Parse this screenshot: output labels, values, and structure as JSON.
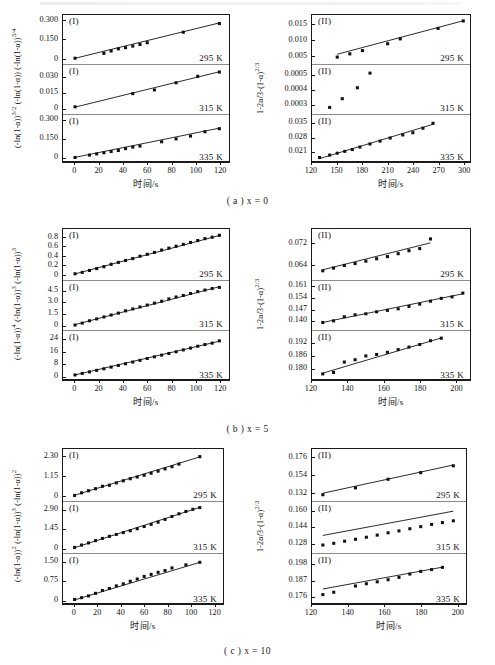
{
  "figure": {
    "xlabel": "时间/s",
    "captions": [
      {
        "id": "a",
        "text": "( a ) x = 0"
      },
      {
        "id": "b",
        "text": "( b ) x = 5"
      },
      {
        "id": "c",
        "text": "( c ) x = 10"
      }
    ],
    "series_marker": "filled-square",
    "line_color": "#111111",
    "marker_color": "#111111"
  },
  "chart_data": [
    {
      "type": "scatter",
      "panel": "a-left",
      "group": "( a ) x = 0",
      "tag": "(I)",
      "ylabel": "(-ln(1-α))^{3/2} (-ln(1-α)) (-ln(1-α))^{3/4}",
      "xlabel": "时间/s",
      "xlim": [
        -10,
        128
      ],
      "xticks": [
        0,
        20,
        40,
        60,
        80,
        100,
        120
      ],
      "grid": false,
      "legend": "none",
      "subplots": [
        {
          "label": "295 K",
          "tag": "(I)",
          "yticks": [
            "0",
            "0.150",
            "0.300"
          ],
          "ylim": [
            -0.02,
            0.315
          ],
          "ytickvals": [
            0,
            0.15,
            0.3
          ],
          "x": [
            0,
            24,
            30,
            36,
            42,
            48,
            54,
            60,
            90,
            120
          ],
          "y": [
            0.004,
            0.042,
            0.06,
            0.077,
            0.086,
            0.098,
            0.11,
            0.124,
            0.205,
            0.272
          ],
          "fit": {
            "intercept": 0.0035,
            "slope": 0.00228
          }
        },
        {
          "label": "315 K",
          "tag": "(I)",
          "yticks": [
            "0",
            "0.015",
            "0.030"
          ],
          "ylim": [
            -0.003,
            0.0385
          ],
          "ytickvals": [
            0,
            0.015,
            0.03
          ],
          "x": [
            0,
            48,
            66,
            84,
            102,
            120
          ],
          "y": [
            0.0005,
            0.0134,
            0.017,
            0.024,
            0.0303,
            0.0345
          ],
          "fit": {
            "intercept": 0.0002,
            "slope": 0.000288
          }
        },
        {
          "label": "335 K",
          "tag": "(I)",
          "yticks": [
            "0",
            "0.150",
            "0.300"
          ],
          "ylim": [
            -0.02,
            0.315
          ],
          "ytickvals": [
            0,
            0.15,
            0.3
          ],
          "x": [
            0,
            12,
            18,
            24,
            30,
            36,
            42,
            48,
            54,
            72,
            84,
            96,
            108,
            120
          ],
          "y": [
            0.003,
            0.022,
            0.031,
            0.04,
            0.05,
            0.058,
            0.073,
            0.085,
            0.093,
            0.127,
            0.15,
            0.172,
            0.206,
            0.23
          ],
          "fit": {
            "intercept": 0.004,
            "slope": 0.00192
          }
        }
      ]
    },
    {
      "type": "scatter",
      "panel": "a-right",
      "group": "( a ) x = 0",
      "tag": "(II)",
      "ylabel": "1-2α/3-(1-α)^{2/3}",
      "xlabel": "时间/s",
      "xlim": [
        120,
        308
      ],
      "xticks": [
        120,
        150,
        180,
        210,
        240,
        270,
        300
      ],
      "grid": false,
      "legend": "none",
      "subplots": [
        {
          "label": "295 K",
          "tag": "(II)",
          "yticks": [
            "0.005",
            "0.010",
            "0.015"
          ],
          "ylim": [
            0.0035,
            0.0168
          ],
          "ytickvals": [
            0.005,
            0.01,
            0.015
          ],
          "x": [
            150,
            165,
            180,
            210,
            225,
            270,
            300
          ],
          "y": [
            0.0048,
            0.0058,
            0.0068,
            0.0089,
            0.0104,
            0.0136,
            0.0159
          ],
          "fit": {
            "intercept": -0.0046,
            "slope": 6.85e-05
          }
        },
        {
          "label": "315 K",
          "tag": "(II)",
          "yticks": [
            "0.0003",
            "0.0004",
            "0.0005"
          ],
          "ylim": [
            0.000258,
            0.000545
          ],
          "ytickvals": [
            0.0003,
            0.0004,
            0.0005
          ],
          "x": [
            141,
            156,
            174,
            189
          ],
          "y": [
            0.000278,
            0.000337,
            0.000411,
            0.00051
          ],
          "fit": {
            "intercept": 0.0,
            "slope": 4.8e-06
          }
        },
        {
          "label": "335 K",
          "tag": "(II)",
          "yticks": [
            "0.021",
            "0.028",
            "0.035"
          ],
          "ylim": [
            0.0168,
            0.0375
          ],
          "ytickvals": [
            0.021,
            0.028,
            0.035
          ],
          "x": [
            129,
            141,
            150,
            159,
            168,
            177,
            189,
            201,
            213,
            228,
            240,
            252,
            264
          ],
          "y": [
            0.0182,
            0.0194,
            0.0203,
            0.0212,
            0.0221,
            0.0233,
            0.0248,
            0.0262,
            0.0277,
            0.0292,
            0.0303,
            0.0325,
            0.0349
          ],
          "fit": {
            "intercept": 0.00167,
            "slope": 0.000124
          }
        }
      ]
    },
    {
      "type": "scatter",
      "panel": "b-left",
      "group": "( b ) x = 5",
      "tag": "(I)",
      "ylabel": "(-ln(1-α))^{4} (-ln(1-α))^{3} (-ln(1-α))^{3}",
      "xlabel": "时间/s",
      "xlim": [
        -10,
        128
      ],
      "xticks": [
        0,
        20,
        40,
        60,
        80,
        100,
        120
      ],
      "grid": false,
      "legend": "none",
      "subplots": [
        {
          "label": "295 K",
          "tag": "(I)",
          "yticks": [
            "0",
            "0.2",
            "0.4",
            "0.6",
            "0.8"
          ],
          "ylim": [
            -0.04,
            0.9
          ],
          "ytickvals": [
            0,
            0.2,
            0.4,
            0.6,
            0.8
          ],
          "x": [
            0,
            6,
            12,
            18,
            24,
            30,
            36,
            42,
            48,
            54,
            60,
            66,
            72,
            78,
            84,
            90,
            96,
            102,
            108,
            114,
            120
          ],
          "y": [
            0.02,
            0.05,
            0.09,
            0.13,
            0.17,
            0.22,
            0.26,
            0.3,
            0.34,
            0.39,
            0.43,
            0.47,
            0.52,
            0.56,
            0.6,
            0.64,
            0.68,
            0.72,
            0.76,
            0.79,
            0.83
          ],
          "fit": {
            "intercept": 0.018,
            "slope": 0.00674
          }
        },
        {
          "label": "315 K",
          "tag": "(I)",
          "yticks": [
            "0",
            "1.5",
            "3.0",
            "4.5"
          ],
          "ylim": [
            -0.3,
            5.4
          ],
          "ytickvals": [
            0,
            1.5,
            3.0,
            4.5
          ],
          "x": [
            0,
            6,
            12,
            18,
            24,
            30,
            36,
            42,
            48,
            54,
            60,
            66,
            72,
            78,
            84,
            90,
            96,
            102,
            108,
            114,
            120
          ],
          "y": [
            0.05,
            0.3,
            0.6,
            0.85,
            1.1,
            1.35,
            1.6,
            1.9,
            2.15,
            2.4,
            2.65,
            2.9,
            3.15,
            3.45,
            3.7,
            3.9,
            4.15,
            4.4,
            4.6,
            4.8,
            4.95
          ],
          "fit": {
            "intercept": 0.1,
            "slope": 0.0412
          }
        },
        {
          "label": "335 K",
          "tag": "(I)",
          "yticks": [
            "0",
            "8",
            "16",
            "24"
          ],
          "ylim": [
            -1.5,
            27
          ],
          "ytickvals": [
            0,
            8,
            16,
            24
          ],
          "x": [
            0,
            6,
            12,
            18,
            24,
            30,
            36,
            42,
            48,
            54,
            60,
            66,
            72,
            78,
            84,
            90,
            96,
            102,
            108,
            114,
            120
          ],
          "y": [
            0.3,
            1.3,
            2.3,
            3.3,
            4.3,
            5.4,
            6.5,
            7.6,
            8.7,
            9.8,
            11.0,
            12.1,
            13.2,
            14.3,
            15.4,
            16.6,
            17.8,
            19.0,
            20.1,
            21.0,
            22.5
          ],
          "fit": {
            "intercept": 0.3,
            "slope": 0.183
          }
        }
      ]
    },
    {
      "type": "scatter",
      "panel": "b-right",
      "group": "( b ) x = 5",
      "tag": "(II)",
      "ylabel": "1-2α/3-(1-α)^{2/3}",
      "xlabel": "时间/s",
      "xlim": [
        120,
        208
      ],
      "xticks": [
        120,
        140,
        160,
        180,
        200
      ],
      "grid": false,
      "legend": "none",
      "subplots": [
        {
          "label": "295 K",
          "tag": "(II)",
          "yticks": [
            "0.064",
            "0.072"
          ],
          "ylim": [
            0.0595,
            0.0762
          ],
          "ytickvals": [
            0.064,
            0.072
          ],
          "x": [
            126,
            132,
            138,
            144,
            150,
            156,
            162,
            168,
            174,
            180,
            186
          ],
          "y": [
            0.0617,
            0.0627,
            0.0637,
            0.0644,
            0.0653,
            0.0662,
            0.067,
            0.0681,
            0.0692,
            0.07,
            0.0736
          ],
          "fit": {
            "intercept": 0.0409,
            "slope": 0.000168
          }
        },
        {
          "label": "315 K",
          "tag": "(II)",
          "yticks": [
            "0.140",
            "0.147",
            "0.154",
            "0.161"
          ],
          "ylim": [
            0.1358,
            0.1625
          ],
          "ytickvals": [
            0.14,
            0.147,
            0.154,
            0.161
          ],
          "x": [
            126,
            132,
            138,
            144,
            150,
            156,
            162,
            168,
            174,
            180,
            186,
            192,
            198,
            204
          ],
          "y": [
            0.139,
            0.14,
            0.1425,
            0.1437,
            0.1443,
            0.1455,
            0.1464,
            0.1473,
            0.1488,
            0.1502,
            0.152,
            0.1537,
            0.1546,
            0.1569
          ],
          "fit": {
            "intercept": 0.1108,
            "slope": 0.000224
          }
        },
        {
          "label": "335 K",
          "tag": "(II)",
          "yticks": [
            "0.180",
            "0.186",
            "0.192"
          ],
          "ylim": [
            0.1755,
            0.1962
          ],
          "ytickvals": [
            0.18,
            0.186,
            0.192
          ],
          "x": [
            126,
            132,
            138,
            144,
            150,
            156,
            162,
            168,
            174,
            180,
            186,
            192
          ],
          "y": [
            0.1773,
            0.178,
            0.1829,
            0.184,
            0.1858,
            0.1865,
            0.1875,
            0.1888,
            0.19,
            0.1912,
            0.193,
            0.1942
          ],
          "fit": {
            "intercept": 0.1459,
            "slope": 0.000252
          }
        }
      ]
    },
    {
      "type": "scatter",
      "panel": "c-left",
      "group": "( c ) x = 10",
      "tag": "(I)",
      "ylabel": "(-ln(1-α))^{2} (-ln(1-α))^{3} (-ln(1-α))^{2}",
      "xlabel": "时间/s",
      "xlim": [
        -10,
        128
      ],
      "xticks": [
        0,
        20,
        40,
        60,
        80,
        100,
        120
      ],
      "grid": false,
      "legend": "none",
      "subplots": [
        {
          "label": "295 K",
          "tag": "(I)",
          "yticks": [
            "0",
            "1.15",
            "2.30"
          ],
          "ylim": [
            -0.12,
            2.55
          ],
          "ytickvals": [
            0,
            1.15,
            2.3
          ],
          "x": [
            0,
            6,
            12,
            18,
            24,
            30,
            36,
            42,
            48,
            54,
            60,
            66,
            72,
            78,
            84,
            90,
            108
          ],
          "y": [
            0.03,
            0.18,
            0.3,
            0.42,
            0.56,
            0.62,
            0.76,
            0.88,
            1.0,
            1.1,
            1.2,
            1.32,
            1.44,
            1.57,
            1.7,
            1.85,
            2.28
          ],
          "fit": {
            "intercept": 0.04,
            "slope": 0.0206
          }
        },
        {
          "label": "315 K",
          "tag": "(I)",
          "yticks": [
            "0",
            "1.45",
            "2.90"
          ],
          "ylim": [
            -0.16,
            3.25
          ],
          "ytickvals": [
            0,
            1.45,
            2.9
          ],
          "x": [
            0,
            6,
            12,
            18,
            24,
            30,
            36,
            42,
            48,
            54,
            60,
            66,
            72,
            78,
            84,
            90,
            96,
            102,
            108
          ],
          "y": [
            0.04,
            0.22,
            0.38,
            0.55,
            0.72,
            0.88,
            1.02,
            1.16,
            1.3,
            1.45,
            1.62,
            1.78,
            1.95,
            2.16,
            2.38,
            2.58,
            2.76,
            2.92,
            3.05
          ],
          "fit": {
            "intercept": 0.02,
            "slope": 0.0282
          }
        },
        {
          "label": "335 K",
          "tag": "(I)",
          "yticks": [
            "0",
            "0.75",
            "1.50"
          ],
          "ylim": [
            -0.08,
            1.68
          ],
          "ytickvals": [
            0,
            0.75,
            1.5
          ],
          "x": [
            0,
            6,
            12,
            18,
            24,
            30,
            36,
            42,
            48,
            54,
            60,
            66,
            72,
            78,
            84,
            96,
            108
          ],
          "y": [
            0.02,
            0.09,
            0.16,
            0.26,
            0.37,
            0.45,
            0.55,
            0.63,
            0.73,
            0.82,
            0.92,
            1.0,
            1.08,
            1.15,
            1.25,
            1.37,
            1.47
          ],
          "fit": {
            "intercept": 0.005,
            "slope": 0.01355
          }
        }
      ]
    },
    {
      "type": "scatter",
      "panel": "c-right",
      "group": "( c ) x = 10",
      "tag": "(II)",
      "ylabel": "1-2α/3-(1-α)^{2/3}",
      "xlabel": "时间/s",
      "xlim": [
        120,
        205
      ],
      "xticks": [
        120,
        140,
        160,
        180,
        200
      ],
      "grid": false,
      "legend": "none",
      "subplots": [
        {
          "label": "295 K",
          "tag": "(II)",
          "yticks": [
            "0.132",
            "0.154",
            "0.176"
          ],
          "ylim": [
            0.1265,
            0.1822
          ],
          "ytickvals": [
            0.132,
            0.154,
            0.176
          ],
          "x": [
            126,
            144,
            162,
            180,
            198
          ],
          "y": [
            0.1305,
            0.1388,
            0.1492,
            0.1572,
            0.1655
          ],
          "fit": {
            "intercept": 0.0726,
            "slope": 0.000474
          }
        },
        {
          "label": "315 K",
          "tag": "(II)",
          "yticks": [
            "0.128",
            "0.144",
            "0.160"
          ],
          "ylim": [
            0.1208,
            0.1655
          ],
          "ytickvals": [
            0.128,
            0.144,
            0.16
          ],
          "x": [
            126,
            132,
            138,
            144,
            150,
            156,
            162,
            168,
            174,
            180,
            186,
            192,
            198
          ],
          "y": [
            0.1258,
            0.1275,
            0.1296,
            0.1315,
            0.1335,
            0.1356,
            0.1379,
            0.1398,
            0.1419,
            0.144,
            0.1462,
            0.148,
            0.1498
          ],
          "fit": {
            "intercept": 0.0932,
            "slope": 0.000334
          }
        },
        {
          "label": "335 K",
          "tag": "(II)",
          "yticks": [
            "0.176",
            "0.187",
            "0.198"
          ],
          "ylim": [
            0.1722,
            0.2025
          ],
          "ytickvals": [
            0.176,
            0.187,
            0.198
          ],
          "x": [
            126,
            132,
            144,
            150,
            156,
            162,
            168,
            174,
            180,
            186,
            192
          ],
          "y": [
            0.1772,
            0.1788,
            0.183,
            0.1845,
            0.1858,
            0.1872,
            0.1888,
            0.191,
            0.1928,
            0.194,
            0.1955
          ],
          "fit": {
            "intercept": 0.153,
            "slope": 0.000222
          }
        }
      ]
    }
  ]
}
